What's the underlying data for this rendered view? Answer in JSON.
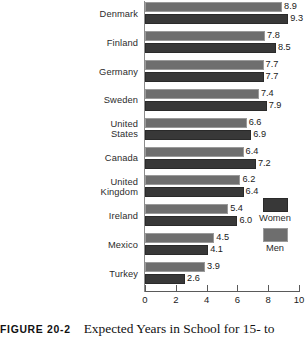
{
  "chart_data": {
    "type": "bar",
    "orientation": "horizontal",
    "title": "Expected Years in School for 15- to",
    "xlabel": "",
    "ylabel": "",
    "xlim": [
      0,
      10
    ],
    "xticks": [
      0,
      2,
      4,
      6,
      8,
      10
    ],
    "grid": false,
    "legend_position": "right",
    "categories": [
      "Denmark",
      "Finland",
      "Germany",
      "Sweden",
      "United States",
      "Canada",
      "United Kingdom",
      "Ireland",
      "Mexico",
      "Turkey"
    ],
    "series": [
      {
        "name": "Men",
        "color": "#6e6e6e",
        "values": [
          8.9,
          7.8,
          7.7,
          7.4,
          6.6,
          6.4,
          6.2,
          5.4,
          4.5,
          3.9
        ]
      },
      {
        "name": "Women",
        "color": "#383838",
        "values": [
          9.3,
          8.5,
          7.7,
          7.9,
          6.9,
          7.2,
          6.4,
          6.0,
          4.1,
          2.6
        ]
      }
    ]
  },
  "category_lines": [
    [
      "Denmark"
    ],
    [
      "Finland"
    ],
    [
      "Germany"
    ],
    [
      "Sweden"
    ],
    [
      "United",
      "States"
    ],
    [
      "Canada"
    ],
    [
      "United",
      "Kingdom"
    ],
    [
      "Ireland"
    ],
    [
      "Mexico"
    ],
    [
      "Turkey"
    ]
  ],
  "legend": {
    "entries": [
      {
        "label": "Women",
        "color": "#383838"
      },
      {
        "label": "Men",
        "color": "#6e6e6e"
      }
    ]
  },
  "caption": {
    "tag": "FIGURE 20-2",
    "text": "Expected Years in School for 15- to"
  }
}
